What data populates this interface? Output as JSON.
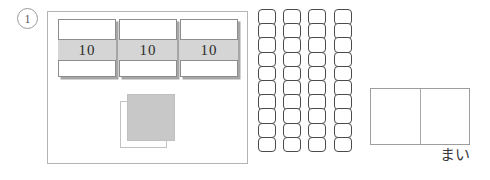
{
  "worksheet": {
    "problem_number": "1",
    "panel_label": "place-value-panel"
  },
  "ten_cards": {
    "count": 3,
    "items": [
      {
        "value": "10"
      },
      {
        "value": "10"
      },
      {
        "value": "10"
      }
    ]
  },
  "unit_square": {
    "solid_label": "grey-square",
    "ghost_label": "outline-square"
  },
  "strips": {
    "group_a_count": 3,
    "group_b_count": 1,
    "cells_per_strip": 10,
    "columns": [
      {
        "name": "strip-1",
        "cells": 10
      },
      {
        "name": "strip-2",
        "cells": 10
      },
      {
        "name": "strip-3",
        "cells": 10
      },
      {
        "name": "strip-4",
        "cells": 10
      }
    ]
  },
  "answer": {
    "value": "",
    "unit_label": "まい",
    "divider": true
  },
  "colors": {
    "card_border": "#8d8d8d",
    "card_shadow": "#a6a6a6",
    "band_fill": "#d5d5d5",
    "panel_border": "#b4b4b4",
    "cell_border": "#4a4a4a",
    "square_fill": "#c8c8c8",
    "answer_border": "#9d9d9d",
    "text": "#2b2b2b"
  }
}
